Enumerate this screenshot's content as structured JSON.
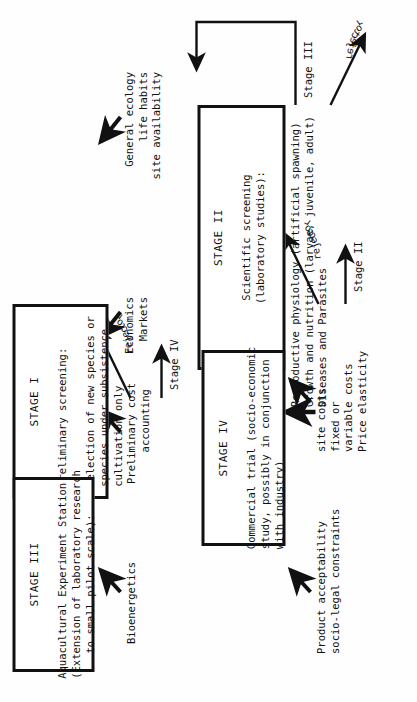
{
  "diagram": {
    "type": "flowchart",
    "orientation": "rotated-90-ccw",
    "stages": [
      {
        "id": "stage-1",
        "title": "STAGE I",
        "body": "Preliminary screening:\n\nSelection of new species or\nspecies under subsistence\ncultivation only",
        "inputs": [
          "General ecology\nlife habits\nsite availability",
          "Economics\nMarkets"
        ],
        "exit_label": "Stage II",
        "reject_label": "reject or"
      },
      {
        "id": "stage-2",
        "title": "STAGE II",
        "body": "Scientific screening\n(laboratory studies):",
        "inputs": [
          "Reproductive physiology (artificial spawning)\nGrowth and nutrition (larvae, juvenile, adult)\nDiseases and Parasites"
        ],
        "exit_label": "Stage III",
        "reject_label": "reject or"
      },
      {
        "id": "stage-3",
        "title": "STAGE III",
        "body": "Aquacultural Experiment Station\n(Extension of laboratory research\n    to small pilot scale):",
        "inputs": [
          "Bioenergetics",
          "Preliminary cost\n     accounting"
        ],
        "exit_label": "Stage IV",
        "reject_label": "reject or"
      },
      {
        "id": "stage-4",
        "title": "STAGE IV",
        "body": "Commercial trial (socio-economic\nstudy, possibly in conjunction\nwith industry)",
        "inputs": [
          "Product acceptability\nsocio-legal constraints",
          "site costs\nfixed or\nvariable costs\nPrice elasticity"
        ],
        "exit_label": "",
        "reject_label": ""
      }
    ],
    "colors": {
      "ink": "#111111",
      "paper": "#fefefe"
    }
  }
}
